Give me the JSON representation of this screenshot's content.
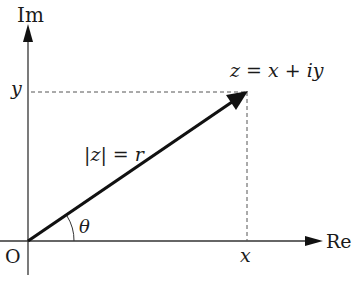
{
  "diagram": {
    "type": "complex-plane",
    "axes": {
      "imaginary_label": "Im",
      "real_label": "Re",
      "origin_label": "O"
    },
    "point": {
      "x_label": "x",
      "y_label": "y",
      "expression": "z = x + iy"
    },
    "modulus": "|z| = r",
    "angle": "θ",
    "colors": {
      "ink": "#1a1a1a",
      "axis": "#333333",
      "dashed": "#555555"
    }
  }
}
